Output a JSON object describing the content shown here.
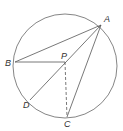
{
  "diagram": {
    "type": "circle-geometry",
    "circle": {
      "cx": 65,
      "cy": 66,
      "r": 52
    },
    "points": {
      "A": {
        "label": "A",
        "x": 101,
        "y": 25,
        "lx": 104,
        "ly": 22
      },
      "B": {
        "label": "B",
        "x": 15,
        "y": 62,
        "lx": 5,
        "ly": 66
      },
      "P": {
        "label": "P",
        "x": 65,
        "y": 62,
        "lx": 61,
        "ly": 59
      },
      "D": {
        "label": "D",
        "x": 30,
        "y": 100,
        "lx": 23,
        "ly": 108
      },
      "C": {
        "label": "C",
        "x": 67,
        "y": 117,
        "lx": 64,
        "ly": 127
      }
    },
    "segments": [
      {
        "from": "A",
        "to": "B",
        "style": "solid"
      },
      {
        "from": "A",
        "to": "D",
        "style": "solid"
      },
      {
        "from": "A",
        "to": "C",
        "style": "solid"
      },
      {
        "from": "B",
        "to": "P",
        "style": "solid"
      },
      {
        "from": "P",
        "to": "C",
        "style": "dashed"
      }
    ],
    "colors": {
      "stroke": "#555555",
      "label": "#333333"
    }
  }
}
